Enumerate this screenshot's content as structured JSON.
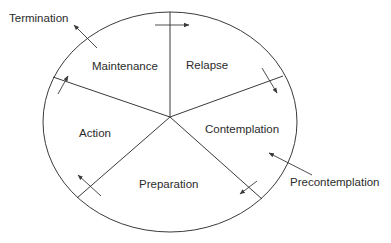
{
  "diagram": {
    "colors": {
      "stroke": "#3a3a3a",
      "text": "#2b2b2b",
      "background": "#ffffff"
    },
    "stages_inside": [
      {
        "id": "maintenance",
        "label": "Maintenance"
      },
      {
        "id": "relapse",
        "label": "Relapse"
      },
      {
        "id": "contemplation",
        "label": "Contemplation"
      },
      {
        "id": "preparation",
        "label": "Preparation"
      },
      {
        "id": "action",
        "label": "Action"
      }
    ],
    "stages_outside": [
      {
        "id": "termination",
        "label": "Termination",
        "arrow": "exit from Maintenance"
      },
      {
        "id": "precontemplation",
        "label": "Precontemplation",
        "arrow": "entry into Contemplation"
      }
    ],
    "flow": [
      "Precontemplation → Contemplation",
      "Contemplation → Preparation",
      "Preparation → Action",
      "Action → Maintenance",
      "Maintenance → Relapse",
      "Relapse → Contemplation",
      "Maintenance → Termination"
    ]
  }
}
